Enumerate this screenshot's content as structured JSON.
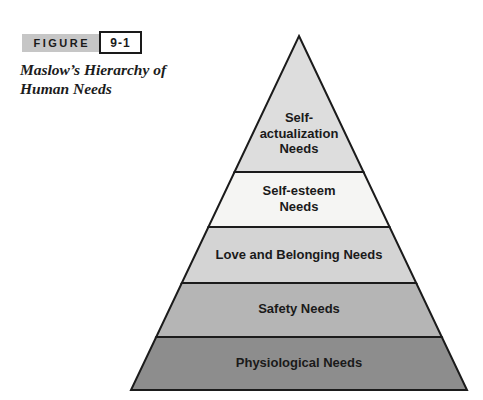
{
  "figure_tag": {
    "label": "FIGURE",
    "number": "9-1"
  },
  "caption": "Maslow’s Hierarchy of\nHuman Needs",
  "pyramid": {
    "title": "Maslow’s Hierarchy of Human Needs",
    "outline_color": "#1b1b1b",
    "levels": [
      {
        "rank": 1,
        "name": "Self-actualization Needs",
        "label": "Self-\nactualization\nNeeds",
        "color": "#dddddd"
      },
      {
        "rank": 2,
        "name": "Self-esteem Needs",
        "label": "Self-esteem\nNeeds",
        "color": "#f5f5f3"
      },
      {
        "rank": 3,
        "name": "Love and Belonging Needs",
        "label": "Love and Belonging Needs",
        "color": "#d4d4d4"
      },
      {
        "rank": 4,
        "name": "Safety Needs",
        "label": "Safety Needs",
        "color": "#b5b5b5"
      },
      {
        "rank": 5,
        "name": "Physiological Needs",
        "label": "Physiological Needs",
        "color": "#8d8d8d"
      }
    ]
  },
  "colors": {
    "figure_bar_bg": "#c6c6c6",
    "text": "#1a1a1a",
    "background": "#ffffff"
  }
}
